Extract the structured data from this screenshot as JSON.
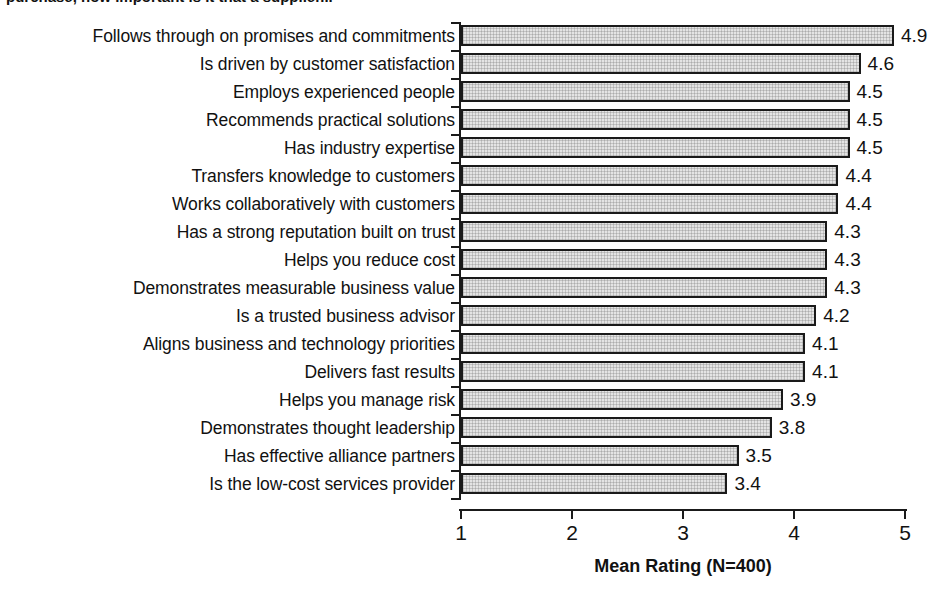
{
  "chart": {
    "title_partial": "purchase, how important is it that a supplier...",
    "type": "bar"
  },
  "chart_data": {
    "type": "bar",
    "orientation": "horizontal",
    "title": "",
    "xlabel": "Mean Rating (N=400)",
    "ylabel": "",
    "xlim": [
      1,
      5
    ],
    "xticks": [
      "1",
      "2",
      "3",
      "4",
      "5"
    ],
    "grid": false,
    "legend": "none",
    "categories": [
      "Follows through on promises and commitments",
      "Is driven by customer satisfaction",
      "Employs experienced people",
      "Recommends practical solutions",
      "Has industry expertise",
      "Transfers knowledge to customers",
      "Works collaboratively with customers",
      "Has a strong reputation built on trust",
      "Helps you reduce cost",
      "Demonstrates measurable business value",
      "Is a trusted business advisor",
      "Aligns business and technology priorities",
      "Delivers fast results",
      "Helps you manage risk",
      "Demonstrates thought leadership",
      "Has effective alliance partners",
      "Is the low-cost services provider"
    ],
    "values": [
      4.9,
      4.6,
      4.5,
      4.5,
      4.5,
      4.4,
      4.4,
      4.3,
      4.3,
      4.3,
      4.2,
      4.1,
      4.1,
      3.9,
      3.8,
      3.5,
      3.4
    ],
    "value_labels": [
      "4.9",
      "4.6",
      "4.5",
      "4.5",
      "4.5",
      "4.4",
      "4.4",
      "4.3",
      "4.3",
      "4.3",
      "4.2",
      "4.1",
      "4.1",
      "3.9",
      "3.8",
      "3.5",
      "3.4"
    ],
    "colors": {
      "bar_fill": "#e4e4e4",
      "bar_border": "#1a1a1a",
      "text": "#111111",
      "background": "#ffffff"
    }
  }
}
